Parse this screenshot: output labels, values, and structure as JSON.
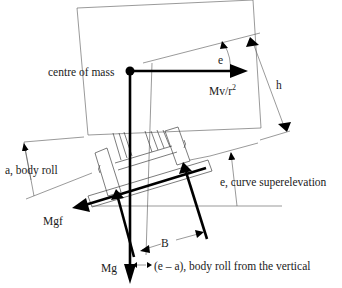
{
  "diagram": {
    "labels": {
      "centre_of_mass": "centre of mass",
      "angle_e_top": "e",
      "centrifugal_force": "Mv/r",
      "centrifugal_exponent": "2",
      "height": "h",
      "body_roll": "a, body roll",
      "superelevation": "e, curve superelevation",
      "friction_force": "Mgf",
      "base_width": "B",
      "weight": "Mg",
      "roll_from_vertical": "(e – a), body roll from the vertical"
    },
    "colors": {
      "force_arrow": "#000000",
      "outline": "#555555",
      "background": "#ffffff"
    }
  }
}
